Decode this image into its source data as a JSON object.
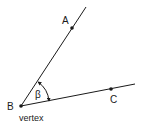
{
  "diagram": {
    "points": [
      {
        "id": "A",
        "label": "A",
        "x": 72,
        "y": 28
      },
      {
        "id": "B",
        "label": "B",
        "x": 21,
        "y": 106
      },
      {
        "id": "C",
        "label": "C",
        "x": 111,
        "y": 89
      }
    ],
    "rays": [
      {
        "from": "B",
        "through": "A"
      },
      {
        "from": "B",
        "through": "C"
      }
    ],
    "angle": {
      "label": "β",
      "vertex": "B"
    },
    "vertex_caption": "vertex",
    "colors": {
      "stroke": "#1a1a1a",
      "background": "#ffffff"
    }
  }
}
